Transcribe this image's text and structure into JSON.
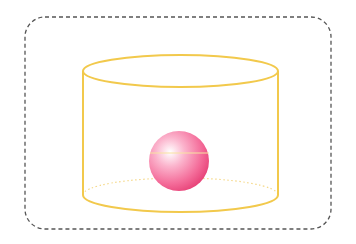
{
  "diagram": {
    "frame": {
      "x": 25,
      "y": 17,
      "width": 306,
      "height": 212,
      "radius": 20,
      "stroke": "#555555",
      "style": "dashed"
    },
    "cylinder": {
      "left": 83,
      "right": 278,
      "top_center_y": 71,
      "bottom_center_y": 195,
      "rx": 97.5,
      "ry": 16,
      "stroke": "#f2c94c",
      "stroke_width": 2,
      "hidden_edge_style": "dotted"
    },
    "sphere": {
      "cx": 179,
      "cy": 161,
      "r": 30,
      "highlight": "#ffffff",
      "mid": "#f77aa3",
      "edge": "#e8457a",
      "equator_line_y": 153,
      "equator_color": "#f8e3a0"
    }
  }
}
